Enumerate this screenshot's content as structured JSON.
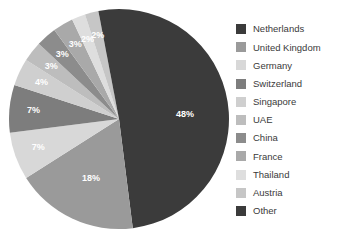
{
  "chart_data": {
    "type": "pie",
    "title": "",
    "legend_position": "right",
    "start_angle_deg": 0,
    "direction": "clockwise",
    "categories": [
      "Netherlands",
      "United Kingdom",
      "Germany",
      "Switzerland",
      "Singapore",
      "UAE",
      "China",
      "France",
      "Thailand",
      "Austria",
      "Other"
    ],
    "values": [
      48,
      18,
      7,
      7,
      4,
      3,
      3,
      3,
      2,
      2,
      3
    ],
    "value_labels": [
      "48%",
      "18%",
      "7%",
      "7%",
      "4%",
      "3%",
      "3%",
      "3%",
      "2%",
      "2%",
      ""
    ],
    "colors": [
      "#3b3b3b",
      "#9a9a9a",
      "#d8d8d8",
      "#7d7d7d",
      "#cfcfcf",
      "#bdbdbd",
      "#8c8c8c",
      "#a9a9a9",
      "#dedede",
      "#c6c6c6",
      "#3b3b3b"
    ],
    "label_text_color": "#ffffff",
    "background": "#ffffff"
  },
  "legend": {
    "items": [
      {
        "label": "Netherlands"
      },
      {
        "label": "United Kingdom"
      },
      {
        "label": "Germany"
      },
      {
        "label": "Switzerland"
      },
      {
        "label": "Singapore"
      },
      {
        "label": "UAE"
      },
      {
        "label": "China"
      },
      {
        "label": "France"
      },
      {
        "label": "Thailand"
      },
      {
        "label": "Austria"
      },
      {
        "label": "Other"
      }
    ]
  }
}
